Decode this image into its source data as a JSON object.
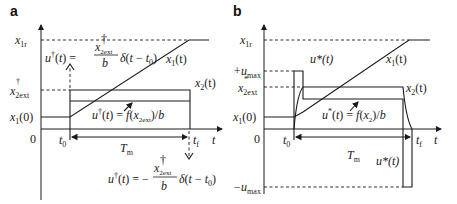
{
  "panels": [
    {
      "id": "a",
      "label": "a",
      "y_labels": {
        "x1r": "x",
        "x1r_sub": "1r",
        "x2ext": "x",
        "x2ext_sup": "†",
        "x2ext_sub": "2ext",
        "x10": "x",
        "x10_sub": "1",
        "x10_arg": "(0)"
      },
      "x_labels": {
        "zero": "0",
        "t0": "t",
        "t0_sub": "0",
        "tf": "t",
        "tf_sub": "f",
        "t_axis": "t"
      },
      "curve_labels": {
        "x1": "x",
        "x1_sup": "†",
        "x1_sub": "1",
        "x1_arg": "(t)",
        "x2": "x",
        "x2_sup": "†",
        "x2_sub": "2",
        "x2_arg": "(t)"
      },
      "annotations": {
        "impulse_start": "u†(t) = (x†2ext / b) δ(t − t0)",
        "impulse_end": "u†(t) = −(x†2ext / b) δ(t − t0)",
        "control_mid": "u†(t) = f(x†2ext)/b",
        "duration": "Tm"
      }
    },
    {
      "id": "b",
      "label": "b",
      "y_labels": {
        "x1r": "x",
        "x1r_sub": "1r",
        "umax_pos": "+u",
        "umax_sub": "max",
        "x2ext": "x",
        "x2ext_sup": "*",
        "x2ext_sub": "2ext",
        "x10": "x",
        "x10_sub": "1",
        "x10_arg": "(0)",
        "umax_neg": "−u",
        "umax_neg_sub": "max"
      },
      "x_labels": {
        "zero": "0",
        "t0": "t",
        "t0_sub": "0",
        "tf": "t",
        "tf_sub": "f",
        "t_axis": "t"
      },
      "curve_labels": {
        "u_top": "u*(t)",
        "u_bottom": "u*(t)",
        "x1": "x",
        "x1_sup": "*",
        "x1_sub": "1",
        "x1_arg": "(t)",
        "x2": "x",
        "x2_sup": "*",
        "x2_sub": "2",
        "x2_arg": "(t)"
      },
      "annotations": {
        "control_mid": "u*(t) = f(x*2)/b",
        "duration": "Tm"
      }
    }
  ]
}
